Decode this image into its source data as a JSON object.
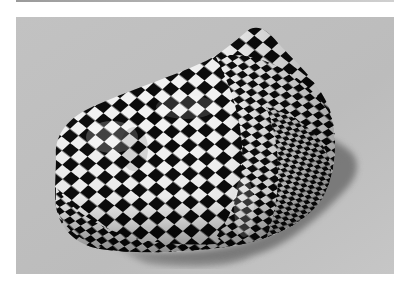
{
  "figure": {
    "colors": {
      "page_background": "#ffffff",
      "floor": "#bdbdbd",
      "floor_light": "#c9c9c9",
      "shadow": "#6e6e6e",
      "checker_dark": "#0a0a0a",
      "checker_light": "#f2f2f2",
      "top_bar": "#a8a8a8"
    }
  }
}
